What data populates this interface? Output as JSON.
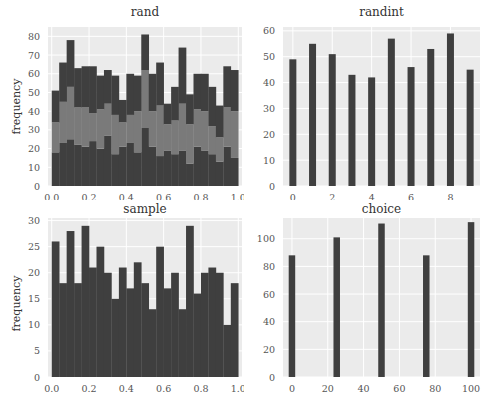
{
  "chart_data": [
    {
      "type": "bar",
      "subtype": "stacked-histogram",
      "title": "rand",
      "xlabel": "",
      "ylabel": "frequency",
      "xlim": [
        -0.02,
        1.02
      ],
      "ylim": [
        0,
        85
      ],
      "xticks": [
        "0.0",
        "0.2",
        "0.4",
        "0.6",
        "0.8",
        "1.0"
      ],
      "xtick_values": [
        0,
        0.2,
        0.4,
        0.6,
        0.8,
        1.0
      ],
      "yticks": [
        "0",
        "10",
        "20",
        "30",
        "40",
        "50",
        "60",
        "70",
        "80"
      ],
      "ytick_values": [
        0,
        10,
        20,
        30,
        40,
        50,
        60,
        70,
        80
      ],
      "grid": true,
      "bins": 25,
      "bin_range": [
        0,
        1
      ],
      "series": [
        {
          "name": "layer1",
          "color": "#3f3f3f",
          "values": [
            18,
            23,
            25,
            22,
            21,
            24,
            20,
            27,
            17,
            21,
            23,
            18,
            31,
            21,
            16,
            19,
            17,
            19,
            12,
            21,
            19,
            17,
            13,
            21,
            15
          ]
        },
        {
          "name": "layer2",
          "color": "#7a7a7a",
          "values": [
            16,
            22,
            28,
            20,
            21,
            15,
            21,
            17,
            21,
            13,
            15,
            22,
            31,
            19,
            27,
            14,
            18,
            25,
            21,
            20,
            21,
            15,
            13,
            21,
            25
          ]
        },
        {
          "name": "layer3",
          "color": "#3f3f3f",
          "values": [
            17,
            21,
            25,
            21,
            22,
            25,
            18,
            18,
            21,
            12,
            22,
            19,
            19,
            20,
            23,
            11,
            18,
            30,
            16,
            19,
            20,
            21,
            17,
            22,
            22
          ]
        }
      ]
    },
    {
      "type": "bar",
      "title": "randint",
      "xlabel": "",
      "ylabel": "",
      "xlim": [
        -0.5,
        9.5
      ],
      "ylim": [
        0,
        61.5
      ],
      "xticks": [
        "0",
        "2",
        "4",
        "6",
        "8"
      ],
      "xtick_values": [
        0,
        2,
        4,
        6,
        8
      ],
      "yticks": [
        "0",
        "10",
        "20",
        "30",
        "40",
        "50",
        "60"
      ],
      "ytick_values": [
        0,
        10,
        20,
        30,
        40,
        50,
        60
      ],
      "grid": true,
      "categories": [
        0,
        1,
        2,
        3,
        4,
        5,
        6,
        7,
        8,
        9
      ],
      "values": [
        49,
        55,
        51,
        43,
        42,
        57,
        46,
        53,
        59,
        45
      ],
      "color": "#3f3f3f"
    },
    {
      "type": "bar",
      "subtype": "histogram",
      "title": "sample",
      "xlabel": "",
      "ylabel": "frequency",
      "xlim": [
        -0.02,
        1.02
      ],
      "ylim": [
        0,
        30.5
      ],
      "xticks": [
        "0.0",
        "0.2",
        "0.4",
        "0.6",
        "0.8",
        "1.0"
      ],
      "xtick_values": [
        0,
        0.2,
        0.4,
        0.6,
        0.8,
        1.0
      ],
      "yticks": [
        "0",
        "5",
        "10",
        "15",
        "20",
        "25",
        "30"
      ],
      "ytick_values": [
        0,
        5,
        10,
        15,
        20,
        25,
        30
      ],
      "grid": true,
      "bins": 25,
      "bin_range": [
        0,
        1
      ],
      "values": [
        26,
        18,
        28,
        18,
        29,
        21,
        25,
        20,
        15,
        21,
        17,
        22,
        18,
        13,
        25,
        17,
        20,
        13,
        29,
        16,
        20,
        21,
        20,
        10,
        18
      ],
      "color": "#3f3f3f"
    },
    {
      "type": "bar",
      "title": "choice",
      "xlabel": "",
      "ylabel": "",
      "xlim": [
        -5,
        105
      ],
      "ylim": [
        0,
        115
      ],
      "xticks": [
        "0",
        "20",
        "40",
        "60",
        "80",
        "100"
      ],
      "xtick_values": [
        0,
        20,
        40,
        60,
        80,
        100
      ],
      "yticks": [
        "0",
        "20",
        "40",
        "60",
        "80",
        "100"
      ],
      "ytick_values": [
        0,
        20,
        40,
        60,
        80,
        100
      ],
      "grid": true,
      "categories": [
        0,
        25,
        50,
        75,
        100
      ],
      "values": [
        88,
        101,
        111,
        88,
        112
      ],
      "color": "#3f3f3f"
    }
  ],
  "style": {
    "plot_bg": "#ebebeb",
    "grid_color": "#ffffff",
    "bar_dark": "#3f3f3f",
    "bar_light": "#7a7a7a",
    "tick_color": "#555555"
  }
}
